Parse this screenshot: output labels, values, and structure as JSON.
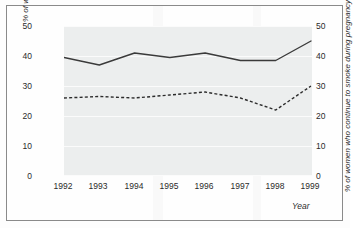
{
  "chart_data": {
    "type": "line",
    "title": "",
    "xlabel": "Year",
    "ylabel": "% of women smoking in 12 months before their pregnancy",
    "ylabel_right": "% of women who continue to smoke during pregnancy",
    "categories": [
      "1992",
      "1993",
      "1994",
      "1995",
      "1996",
      "1997",
      "1998",
      "1999"
    ],
    "ylim": [
      0,
      50
    ],
    "yticks": [
      "0",
      "10",
      "20",
      "30",
      "40",
      "50"
    ],
    "ylim_right": [
      0,
      50
    ],
    "yticks_right": [
      "0",
      "10",
      "20",
      "30",
      "40",
      "50"
    ],
    "grid": true,
    "legend": "none",
    "series": [
      {
        "name": "% of women smoking in 12 months before their pregnancy",
        "style": "solid",
        "axis": "left",
        "color": "#3a3a3a",
        "values": [
          39.5,
          37.0,
          41.0,
          39.5,
          41.0,
          38.5,
          38.5,
          45.0
        ]
      },
      {
        "name": "% of women who continue to smoke during pregnancy",
        "style": "dashed",
        "axis": "right",
        "color": "#2b2b2b",
        "values": [
          26.0,
          26.5,
          26.0,
          27.0,
          28.0,
          26.0,
          22.0,
          30.0
        ]
      }
    ]
  },
  "axes": {
    "y_left_label_line1": "% of women smoking in 12 months",
    "y_left_label_line2": "before their pregnancy",
    "y_right_label": "% of women who continue to smoke during pregnancy",
    "x_label": "Year"
  },
  "colors": {
    "plot_background": "#eceeee",
    "frame_border": "#8a8a8a",
    "gridline": "#fbfbfb",
    "series_solid": "#3a3a3a",
    "series_dashed": "#2b2b2b",
    "text": "#2b2b2b"
  }
}
